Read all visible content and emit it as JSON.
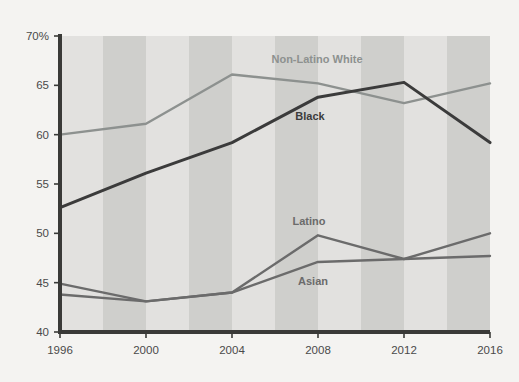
{
  "figure": {
    "background_color": "#f4f3f1",
    "plot_band_light": "#e2e1df",
    "plot_band_dark": "#cfcfcc",
    "axis_color": "#3a3a38"
  },
  "axis": {
    "y_ticks": [
      "70%",
      "65",
      "60",
      "55",
      "50",
      "45",
      "40"
    ],
    "x_ticks": [
      "1996",
      "2000",
      "2004",
      "2008",
      "2012",
      "2016"
    ]
  },
  "series_labels": {
    "non_latino_white": "Non-Latino White",
    "black": "Black",
    "latino": "Latino",
    "asian": "Asian"
  },
  "chart_data": {
    "type": "line",
    "title": "",
    "xlabel": "",
    "ylabel": "",
    "x": [
      1996,
      2000,
      2004,
      2008,
      2012,
      2016
    ],
    "xtick_labels": [
      "1996",
      "2000",
      "2004",
      "2008",
      "2012",
      "2016"
    ],
    "ytick_labels": [
      "70%",
      "65",
      "60",
      "55",
      "50",
      "45",
      "40"
    ],
    "ytick_values": [
      70,
      65,
      60,
      55,
      50,
      45,
      40
    ],
    "ylim": [
      40,
      70
    ],
    "xlim": [
      1996,
      2016
    ],
    "grid": false,
    "legend": "inline-annotations",
    "series": [
      {
        "name": "Non-Latino White",
        "color": "#8d918f",
        "values": [
          60.0,
          61.1,
          66.1,
          65.2,
          63.2,
          65.2
        ]
      },
      {
        "name": "Black",
        "color": "#3b3b3b",
        "values": [
          52.6,
          56.1,
          59.2,
          63.8,
          65.3,
          59.2
        ]
      },
      {
        "name": "Latino",
        "color": "#6b6b6b",
        "values": [
          44.9,
          43.1,
          44.0,
          49.8,
          47.4,
          47.7
        ]
      },
      {
        "name": "Asian",
        "color": "#6b6b6b",
        "values": [
          43.8,
          43.1,
          44.0,
          47.1,
          47.4,
          50.0
        ]
      }
    ]
  }
}
